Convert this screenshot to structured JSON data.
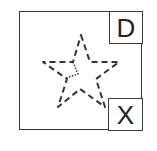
{
  "widget": {
    "frame_color": "#3a3a3a",
    "star_color": "#333333",
    "shape": "star-outline-dashed",
    "top_right_button": {
      "label": "D",
      "icon": "d-letter-icon"
    },
    "bottom_right_button": {
      "label": "X",
      "icon": "close-icon"
    }
  }
}
